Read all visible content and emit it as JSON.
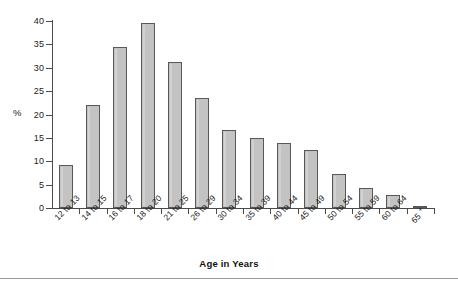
{
  "chart_data": {
    "type": "bar",
    "title": "",
    "xlabel": "Age in Years",
    "ylabel": "%",
    "categories": [
      "12 to 13",
      "14 to 15",
      "16 to 17",
      "18 to 20",
      "21 to 25",
      "26 to 29",
      "30 to 34",
      "35 to 39",
      "40 to 44",
      "45 to 49",
      "50 to 54",
      "55 to 59",
      "60 to 64",
      "65 +"
    ],
    "values": [
      9.2,
      22.0,
      34.5,
      39.5,
      31.3,
      23.5,
      16.6,
      15.0,
      14.0,
      12.5,
      7.3,
      4.3,
      2.8,
      0.5
    ],
    "ylim": [
      0,
      40
    ],
    "ytick_labels": [
      "0",
      "5",
      "10",
      "15",
      "20",
      "25",
      "30",
      "35",
      "40"
    ],
    "ytick_values": [
      0,
      5,
      10,
      15,
      20,
      25,
      30,
      35,
      40
    ],
    "grid": false,
    "legend": "none",
    "bar_color": "#c3c3c3",
    "bar_edge_color": "#585858",
    "axis_color": "#4a4a4a",
    "background": "#ffffff"
  }
}
